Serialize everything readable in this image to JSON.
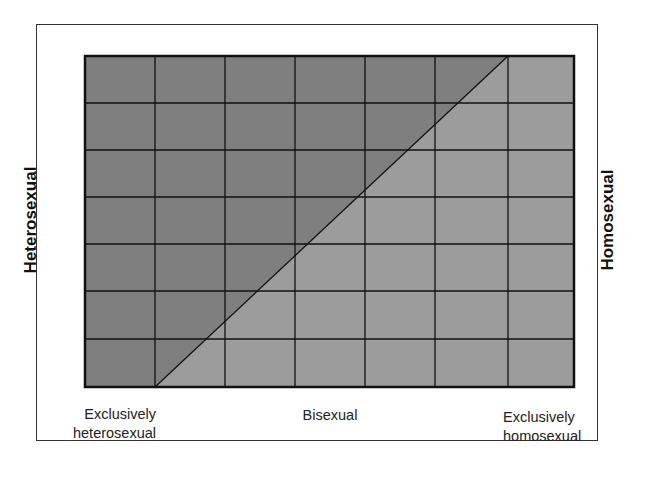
{
  "diagram": {
    "grid": {
      "columns": 7,
      "rows": 7
    },
    "colors": {
      "heterosexual_region": "#7f7f7f",
      "homosexual_region": "#9c9c9c",
      "grid_lines": "#111111",
      "frame": "#333333",
      "background": "#ffffff"
    },
    "side_labels": {
      "left": "Heterosexual",
      "right": "Homosexual"
    },
    "bottom_labels": {
      "left_line1": "Exclusively",
      "left_line2": "heterosexual",
      "middle": "Bisexual",
      "right_line1": "Exclusively",
      "right_line2": "homosexual"
    },
    "diagonal": {
      "description": "Line from bottom of column 1 boundary to top of column 6 boundary, separating heterosexual (upper-left, darker) and homosexual (lower-right, lighter) regions"
    }
  }
}
